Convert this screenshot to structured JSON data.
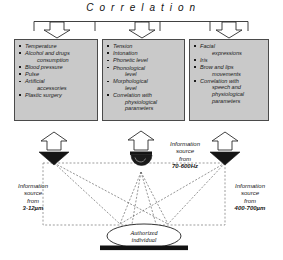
{
  "diagram": {
    "title": "C o r r e l a t i o n",
    "title_plain": "Correlation"
  },
  "panels": [
    {
      "name": "physiological-panel",
      "items": [
        {
          "main": "Temperature",
          "cont": ""
        },
        {
          "main": "Alcohol and drugs",
          "cont": "consumption"
        },
        {
          "main": "Blood pressure",
          "cont": ""
        },
        {
          "main": "Pulse",
          "cont": ""
        },
        {
          "main": "Artificial",
          "cont": "accessories"
        },
        {
          "main": "Plastic surgery",
          "cont": ""
        }
      ]
    },
    {
      "name": "speech-panel",
      "items": [
        {
          "main": "Tension",
          "cont": ""
        },
        {
          "main": "Intonation",
          "cont": ""
        },
        {
          "main": "Phonetic level",
          "cont": ""
        },
        {
          "main": "Phonological",
          "cont": "level"
        },
        {
          "main": "Morphological",
          "cont": "level"
        },
        {
          "main": "Correlation with",
          "cont": "physiological parameters"
        }
      ]
    },
    {
      "name": "visual-panel",
      "items": [
        {
          "main": "Facial",
          "cont": "expressions"
        },
        {
          "main": "Iris",
          "cont": ""
        },
        {
          "main": "Brow and lips",
          "cont": "movements"
        },
        {
          "main": "Correlation with",
          "cont": "speech and physiological parameters"
        }
      ]
    }
  ],
  "sensors": [
    {
      "name": "infrared-camera",
      "icon": "camera-triangle-icon",
      "label_lines": [
        "Information",
        "source",
        "from"
      ],
      "range": "3-12µm"
    },
    {
      "name": "microphone",
      "icon": "microphone-dome-icon",
      "label_lines": [
        "Information",
        "source",
        "from"
      ],
      "range": "70-600Hz"
    },
    {
      "name": "visible-camera",
      "icon": "camera-triangle-icon",
      "label_lines": [
        "Information",
        "source",
        "from"
      ],
      "range": "400-700µm"
    }
  ],
  "subject": {
    "name": "authorized-individual",
    "line1": "Authorized",
    "line2": "individual"
  },
  "colors": {
    "panel_fill": "#c9c9c9",
    "panel_border": "#4a4a4a",
    "ink": "#1a1a1a",
    "sensor_black": "#111111",
    "background": "#ffffff"
  }
}
